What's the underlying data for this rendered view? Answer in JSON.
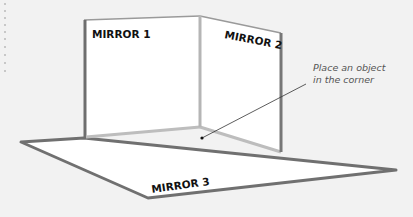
{
  "diagram": {
    "mirrors": [
      {
        "id": "mirror-1",
        "label": "MIRROR 1"
      },
      {
        "id": "mirror-2",
        "label": "MIRROR 2"
      },
      {
        "id": "mirror-3",
        "label": "MIRROR 3"
      }
    ],
    "annotation": {
      "line1": "Place an object",
      "line2": "in the corner"
    },
    "colors": {
      "background": "#f2f2f2",
      "panel_fill": "#ffffff",
      "edge_dark": "#6e6e6e",
      "edge_light": "#b8b8b8",
      "text": "#111111",
      "note": "#555555"
    }
  }
}
